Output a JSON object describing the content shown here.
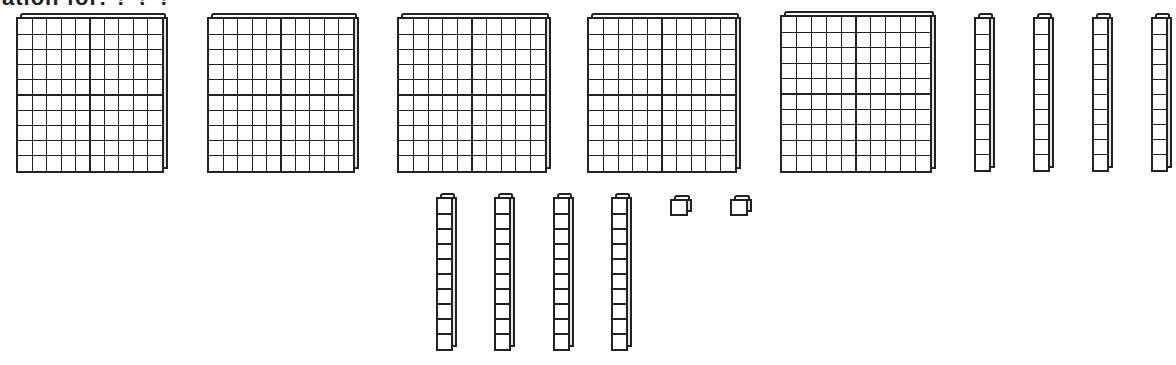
{
  "caption": "ation for: ? ? ?",
  "model": {
    "description": "Base-ten blocks",
    "hundreds_count": 5,
    "tens_count": 8,
    "ones_count": 2,
    "total_value": 582
  },
  "colors": {
    "line": "#222222",
    "face": "#ffffff",
    "side": "#e6e6e6"
  },
  "flats": [
    {
      "x": 16,
      "y": 17,
      "w": 148,
      "h": 156
    },
    {
      "x": 207,
      "y": 17,
      "w": 148,
      "h": 156
    },
    {
      "x": 397,
      "y": 17,
      "w": 150,
      "h": 156
    },
    {
      "x": 587,
      "y": 17,
      "w": 150,
      "h": 156
    },
    {
      "x": 780,
      "y": 15,
      "w": 152,
      "h": 158
    }
  ],
  "rods": [
    {
      "x": 974,
      "y": 17,
      "w": 17,
      "h": 155
    },
    {
      "x": 1033,
      "y": 17,
      "w": 17,
      "h": 155
    },
    {
      "x": 1092,
      "y": 17,
      "w": 17,
      "h": 155
    },
    {
      "x": 1151,
      "y": 17,
      "w": 17,
      "h": 155
    },
    {
      "x": 436,
      "y": 197,
      "w": 17,
      "h": 154
    },
    {
      "x": 494,
      "y": 197,
      "w": 17,
      "h": 154
    },
    {
      "x": 553,
      "y": 197,
      "w": 17,
      "h": 154
    },
    {
      "x": 611,
      "y": 197,
      "w": 17,
      "h": 154
    }
  ],
  "units": [
    {
      "x": 670,
      "y": 199,
      "w": 18,
      "h": 17
    },
    {
      "x": 730,
      "y": 199,
      "w": 18,
      "h": 17
    }
  ]
}
